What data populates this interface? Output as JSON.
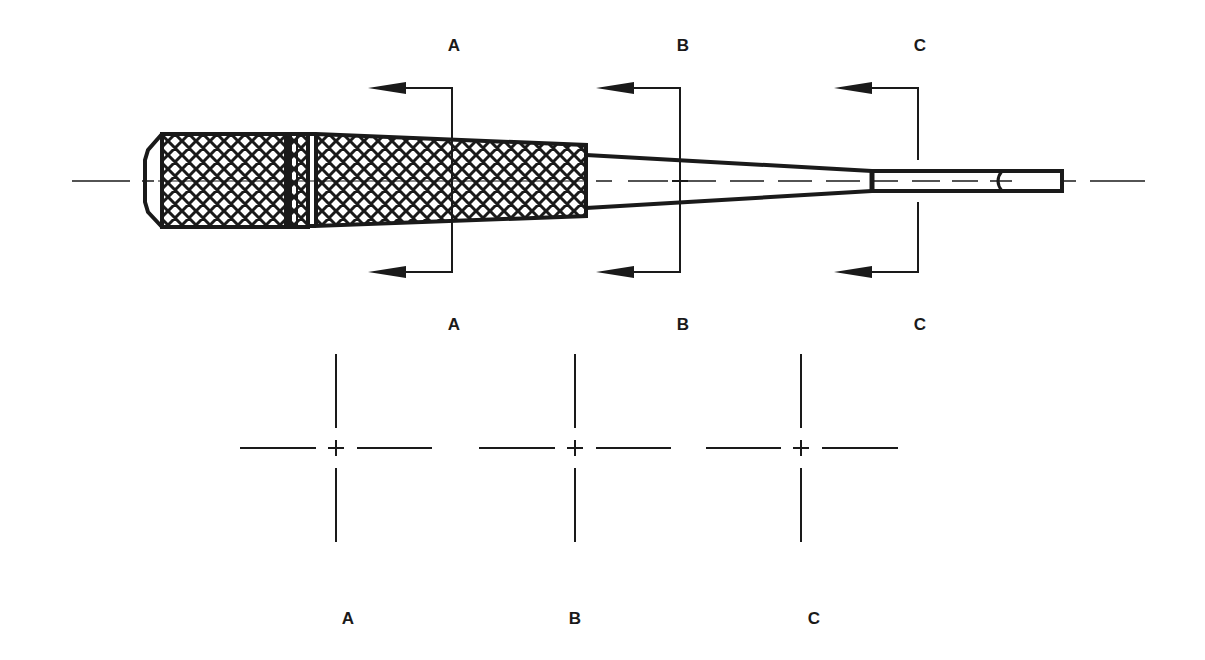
{
  "diagram": {
    "type": "technical-drawing",
    "stroke_color": "#1a1a1a",
    "background": "#ffffff",
    "section_labels_top": [
      {
        "text": "A",
        "x": 454,
        "y": 45
      },
      {
        "text": "B",
        "x": 683,
        "y": 45
      },
      {
        "text": "C",
        "x": 920,
        "y": 45
      }
    ],
    "section_labels_mid": [
      {
        "text": "A",
        "x": 454,
        "y": 324
      },
      {
        "text": "B",
        "x": 683,
        "y": 324
      },
      {
        "text": "C",
        "x": 920,
        "y": 324
      }
    ],
    "section_views": [
      {
        "label": "A",
        "cx": 336,
        "cy": 448,
        "label_x": 348,
        "label_y": 618
      },
      {
        "label": "B",
        "cx": 575,
        "cy": 448,
        "label_x": 575,
        "label_y": 618
      },
      {
        "label": "C",
        "cx": 801,
        "cy": 448,
        "label_x": 814,
        "label_y": 618
      }
    ],
    "section_cuts": [
      {
        "name": "A",
        "x": 452,
        "top_y": 88,
        "bottom_y": 272,
        "arrow_tip_x": 368
      },
      {
        "name": "B",
        "x": 680,
        "top_y": 88,
        "bottom_y": 272,
        "arrow_tip_x": 596
      },
      {
        "name": "C",
        "x": 918,
        "top_y": 88,
        "bottom_y": 272,
        "arrow_tip_x": 834
      }
    ],
    "parts": [
      "handle-cap",
      "knurled-handle-front",
      "knurled-ring",
      "knurled-handle-main",
      "tapered-shank",
      "tip-blade"
    ]
  }
}
